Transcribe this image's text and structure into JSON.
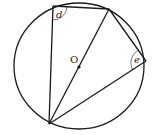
{
  "diagram": {
    "circle": {
      "cx": 79,
      "cy": 66,
      "r": 64
    },
    "points": {
      "A": {
        "x": 53,
        "y": 6
      },
      "B": {
        "x": 109,
        "y": 9
      },
      "C": {
        "x": 146,
        "y": 61
      },
      "D": {
        "x": 49,
        "y": 124
      },
      "O": {
        "x": 79,
        "y": 67
      }
    },
    "labels": {
      "center": "O",
      "angle_d": "d",
      "angle_e": "e"
    },
    "colors": {
      "stroke": "#1a1a1a",
      "background": "#ffffff"
    }
  }
}
